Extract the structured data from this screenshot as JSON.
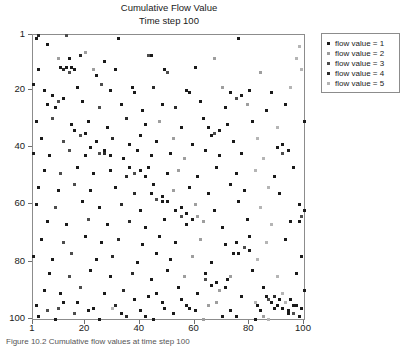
{
  "figure": {
    "title_lines": [
      "Cumulative Flow Value",
      "Time step 100"
    ],
    "caption": "Figure 10.2  Cumulative flow values at time step 100"
  },
  "axes": {
    "x_ticks": [
      "1",
      "20",
      "40",
      "60",
      "80",
      "100"
    ],
    "y_ticks": [
      "1",
      "20",
      "40",
      "60",
      "80",
      "100"
    ]
  },
  "legend": {
    "items": [
      {
        "label": "flow value = 1",
        "color": "#1a1a1a"
      },
      {
        "label": "flow value = 2",
        "color": "#9e9e9e"
      },
      {
        "label": "flow value = 3",
        "color": "#4d4d4d"
      },
      {
        "label": "flow value = 4",
        "color": "#2b2b2b"
      },
      {
        "label": "flow value = 5",
        "color": "#b5b5b5"
      }
    ]
  },
  "chart_data": {
    "type": "scatter",
    "title": "Cumulative Flow Value",
    "subtitle": "Time step 100",
    "xlabel": "",
    "ylabel": "",
    "xlim": [
      1,
      100
    ],
    "ylim": [
      1,
      100
    ],
    "y_inverted": true,
    "grid": false,
    "legend_position": "right-outside",
    "marker": "square",
    "marker_size_px": 3,
    "series": [
      {
        "name": "flow value = 1",
        "color": "#1a1a1a"
      },
      {
        "name": "flow value = 2",
        "color": "#9e9e9e"
      },
      {
        "name": "flow value = 3",
        "color": "#4d4d4d"
      },
      {
        "name": "flow value = 4",
        "color": "#2b2b2b"
      },
      {
        "name": "flow value = 5",
        "color": "#b5b5b5"
      }
    ],
    "points": [
      [
        2,
        2,
        1
      ],
      [
        3,
        1,
        4
      ],
      [
        6,
        4,
        1
      ],
      [
        13,
        1,
        3
      ],
      [
        32,
        2,
        1
      ],
      [
        76,
        2,
        1
      ],
      [
        98,
        5,
        5
      ],
      [
        10,
        9,
        2
      ],
      [
        14,
        9,
        1
      ],
      [
        18,
        8,
        4
      ],
      [
        20,
        7,
        2
      ],
      [
        27,
        10,
        1
      ],
      [
        43,
        8,
        3
      ],
      [
        44,
        8,
        1
      ],
      [
        67,
        9,
        2
      ],
      [
        97,
        9,
        5
      ],
      [
        3,
        13,
        1
      ],
      [
        11,
        12,
        1
      ],
      [
        12,
        13,
        4
      ],
      [
        13,
        12,
        1
      ],
      [
        14,
        14,
        3
      ],
      [
        15,
        12,
        1
      ],
      [
        16,
        13,
        1
      ],
      [
        23,
        13,
        2
      ],
      [
        24,
        15,
        1
      ],
      [
        31,
        13,
        1
      ],
      [
        49,
        13,
        1
      ],
      [
        50,
        14,
        3
      ],
      [
        60,
        12,
        1
      ],
      [
        84,
        14,
        2
      ],
      [
        99,
        13,
        5
      ],
      [
        1,
        18,
        1
      ],
      [
        5,
        20,
        1
      ],
      [
        17,
        19,
        1
      ],
      [
        26,
        18,
        3
      ],
      [
        29,
        20,
        1
      ],
      [
        37,
        19,
        1
      ],
      [
        38,
        21,
        1
      ],
      [
        45,
        19,
        4
      ],
      [
        57,
        20,
        1
      ],
      [
        58,
        21,
        1
      ],
      [
        70,
        19,
        2
      ],
      [
        80,
        20,
        1
      ],
      [
        88,
        21,
        1
      ],
      [
        95,
        19,
        5
      ],
      [
        6,
        25,
        1
      ],
      [
        9,
        26,
        1
      ],
      [
        19,
        24,
        1
      ],
      [
        25,
        26,
        3
      ],
      [
        33,
        25,
        1
      ],
      [
        41,
        27,
        1
      ],
      [
        48,
        25,
        1
      ],
      [
        53,
        26,
        4
      ],
      [
        62,
        24,
        1
      ],
      [
        71,
        26,
        1
      ],
      [
        79,
        25,
        2
      ],
      [
        86,
        27,
        1
      ],
      [
        93,
        25,
        1
      ],
      [
        2,
        31,
        1
      ],
      [
        8,
        30,
        3
      ],
      [
        15,
        32,
        1
      ],
      [
        21,
        31,
        1
      ],
      [
        28,
        33,
        1
      ],
      [
        35,
        30,
        4
      ],
      [
        42,
        32,
        1
      ],
      [
        47,
        31,
        2
      ],
      [
        55,
        33,
        1
      ],
      [
        63,
        30,
        1
      ],
      [
        72,
        32,
        1
      ],
      [
        81,
        31,
        1
      ],
      [
        90,
        33,
        5
      ],
      [
        100,
        31,
        1
      ],
      [
        4,
        37,
        1
      ],
      [
        12,
        38,
        3
      ],
      [
        18,
        36,
        1
      ],
      [
        24,
        38,
        1
      ],
      [
        30,
        37,
        4
      ],
      [
        36,
        39,
        1
      ],
      [
        40,
        36,
        1
      ],
      [
        46,
        38,
        1
      ],
      [
        52,
        37,
        2
      ],
      [
        59,
        39,
        1
      ],
      [
        66,
        36,
        1
      ],
      [
        74,
        38,
        1
      ],
      [
        83,
        37,
        5
      ],
      [
        92,
        39,
        1
      ],
      [
        1,
        42,
        1
      ],
      [
        7,
        43,
        1
      ],
      [
        14,
        41,
        3
      ],
      [
        20,
        43,
        1
      ],
      [
        27,
        42,
        4
      ],
      [
        34,
        44,
        1
      ],
      [
        39,
        41,
        1
      ],
      [
        44,
        43,
        1
      ],
      [
        51,
        42,
        1
      ],
      [
        56,
        44,
        2
      ],
      [
        64,
        41,
        1
      ],
      [
        69,
        43,
        1
      ],
      [
        77,
        42,
        1
      ],
      [
        85,
        44,
        5
      ],
      [
        94,
        41,
        1
      ],
      [
        5,
        48,
        1
      ],
      [
        11,
        49,
        3
      ],
      [
        17,
        47,
        1
      ],
      [
        23,
        49,
        1
      ],
      [
        29,
        48,
        1
      ],
      [
        35,
        50,
        4
      ],
      [
        43,
        47,
        1
      ],
      [
        50,
        49,
        1
      ],
      [
        54,
        48,
        2
      ],
      [
        61,
        50,
        1
      ],
      [
        68,
        47,
        1
      ],
      [
        75,
        49,
        1
      ],
      [
        82,
        48,
        5
      ],
      [
        89,
        50,
        1
      ],
      [
        96,
        47,
        1
      ],
      [
        3,
        54,
        1
      ],
      [
        10,
        55,
        1
      ],
      [
        16,
        53,
        3
      ],
      [
        22,
        55,
        1
      ],
      [
        31,
        54,
        1
      ],
      [
        38,
        56,
        4
      ],
      [
        45,
        53,
        1
      ],
      [
        52,
        55,
        2
      ],
      [
        58,
        54,
        1
      ],
      [
        65,
        56,
        1
      ],
      [
        73,
        53,
        1
      ],
      [
        78,
        55,
        1
      ],
      [
        87,
        54,
        5
      ],
      [
        91,
        56,
        1
      ],
      [
        2,
        60,
        1
      ],
      [
        9,
        61,
        3
      ],
      [
        19,
        59,
        1
      ],
      [
        25,
        61,
        1
      ],
      [
        33,
        60,
        4
      ],
      [
        40,
        62,
        1
      ],
      [
        48,
        59,
        1
      ],
      [
        55,
        61,
        1
      ],
      [
        60,
        60,
        2
      ],
      [
        67,
        62,
        1
      ],
      [
        76,
        59,
        1
      ],
      [
        84,
        61,
        5
      ],
      [
        98,
        60,
        1
      ],
      [
        6,
        66,
        1
      ],
      [
        13,
        67,
        1
      ],
      [
        21,
        65,
        3
      ],
      [
        28,
        67,
        1
      ],
      [
        36,
        66,
        4
      ],
      [
        42,
        68,
        1
      ],
      [
        49,
        65,
        1
      ],
      [
        57,
        67,
        1
      ],
      [
        63,
        66,
        2
      ],
      [
        70,
        68,
        1
      ],
      [
        79,
        65,
        1
      ],
      [
        88,
        67,
        5
      ],
      [
        95,
        66,
        1
      ],
      [
        4,
        72,
        1
      ],
      [
        12,
        73,
        3
      ],
      [
        20,
        71,
        1
      ],
      [
        26,
        73,
        1
      ],
      [
        32,
        72,
        4
      ],
      [
        41,
        74,
        1
      ],
      [
        47,
        71,
        1
      ],
      [
        53,
        73,
        1
      ],
      [
        62,
        72,
        2
      ],
      [
        71,
        74,
        1
      ],
      [
        80,
        71,
        1
      ],
      [
        86,
        73,
        5
      ],
      [
        93,
        72,
        1
      ],
      [
        1,
        78,
        1
      ],
      [
        8,
        79,
        1
      ],
      [
        15,
        77,
        3
      ],
      [
        24,
        79,
        1
      ],
      [
        30,
        78,
        4
      ],
      [
        39,
        80,
        1
      ],
      [
        46,
        77,
        1
      ],
      [
        51,
        79,
        1
      ],
      [
        59,
        78,
        2
      ],
      [
        66,
        80,
        1
      ],
      [
        74,
        77,
        1
      ],
      [
        83,
        79,
        5
      ],
      [
        99,
        78,
        1
      ],
      [
        7,
        84,
        1
      ],
      [
        14,
        85,
        3
      ],
      [
        22,
        83,
        1
      ],
      [
        29,
        85,
        1
      ],
      [
        37,
        84,
        4
      ],
      [
        44,
        86,
        1
      ],
      [
        50,
        83,
        1
      ],
      [
        56,
        85,
        2
      ],
      [
        64,
        84,
        1
      ],
      [
        72,
        86,
        1
      ],
      [
        81,
        83,
        1
      ],
      [
        90,
        85,
        5
      ],
      [
        97,
        84,
        1
      ],
      [
        5,
        90,
        1
      ],
      [
        11,
        91,
        1
      ],
      [
        18,
        89,
        3
      ],
      [
        27,
        91,
        1
      ],
      [
        34,
        90,
        4
      ],
      [
        43,
        92,
        1
      ],
      [
        54,
        89,
        1
      ],
      [
        61,
        91,
        1
      ],
      [
        69,
        90,
        2
      ],
      [
        77,
        92,
        1
      ],
      [
        85,
        89,
        1
      ],
      [
        92,
        91,
        5
      ],
      [
        100,
        90,
        1
      ],
      [
        2,
        95,
        1
      ],
      [
        10,
        96,
        3
      ],
      [
        17,
        94,
        1
      ],
      [
        23,
        96,
        1
      ],
      [
        31,
        95,
        4
      ],
      [
        40,
        97,
        1
      ],
      [
        48,
        94,
        1
      ],
      [
        58,
        96,
        1
      ],
      [
        65,
        95,
        2
      ],
      [
        73,
        97,
        1
      ],
      [
        82,
        94,
        5
      ],
      [
        89,
        96,
        1
      ],
      [
        96,
        95,
        1
      ],
      [
        3,
        99,
        1
      ],
      [
        9,
        100,
        1
      ],
      [
        16,
        98,
        3
      ],
      [
        25,
        100,
        1
      ],
      [
        35,
        99,
        4
      ],
      [
        45,
        100,
        1
      ],
      [
        52,
        98,
        1
      ],
      [
        63,
        100,
        2
      ],
      [
        75,
        99,
        1
      ],
      [
        87,
        100,
        5
      ],
      [
        94,
        98,
        1
      ],
      [
        86,
        92,
        1
      ],
      [
        87,
        93,
        3
      ],
      [
        88,
        94,
        1
      ],
      [
        89,
        92,
        4
      ],
      [
        90,
        95,
        1
      ],
      [
        91,
        93,
        1
      ],
      [
        92,
        96,
        1
      ],
      [
        93,
        94,
        5
      ],
      [
        94,
        97,
        1
      ],
      [
        95,
        93,
        1
      ],
      [
        96,
        98,
        3
      ],
      [
        97,
        95,
        1
      ],
      [
        98,
        99,
        1
      ],
      [
        99,
        96,
        1
      ],
      [
        84,
        97,
        1
      ],
      [
        85,
        99,
        2
      ],
      [
        83,
        95,
        1
      ],
      [
        82,
        100,
        1
      ],
      [
        30,
        96,
        5
      ],
      [
        33,
        98,
        1
      ],
      [
        21,
        97,
        1
      ],
      [
        12,
        94,
        1
      ],
      [
        6,
        97,
        3
      ],
      [
        55,
        93,
        1
      ],
      [
        57,
        95,
        1
      ],
      [
        60,
        97,
        1
      ],
      [
        68,
        94,
        2
      ],
      [
        70,
        99,
        1
      ],
      [
        46,
        91,
        1
      ],
      [
        38,
        93,
        1
      ],
      [
        42,
        99,
        1
      ],
      [
        49,
        96,
        1
      ],
      [
        64,
        86,
        3
      ],
      [
        66,
        88,
        1
      ],
      [
        68,
        87,
        1
      ],
      [
        71,
        89,
        1
      ],
      [
        73,
        85,
        2
      ],
      [
        75,
        73,
        1
      ],
      [
        78,
        75,
        3
      ],
      [
        76,
        77,
        1
      ],
      [
        80,
        76,
        1
      ],
      [
        53,
        62,
        1
      ],
      [
        55,
        64,
        3
      ],
      [
        57,
        63,
        1
      ],
      [
        59,
        65,
        1
      ],
      [
        61,
        64,
        2
      ],
      [
        44,
        56,
        1
      ],
      [
        46,
        58,
        3
      ],
      [
        48,
        57,
        1
      ],
      [
        50,
        59,
        1
      ],
      [
        36,
        47,
        1
      ],
      [
        38,
        49,
        3
      ],
      [
        40,
        48,
        1
      ],
      [
        42,
        50,
        1
      ],
      [
        22,
        40,
        1
      ],
      [
        25,
        42,
        3
      ],
      [
        27,
        41,
        1
      ],
      [
        29,
        43,
        1
      ],
      [
        16,
        34,
        1
      ],
      [
        18,
        36,
        3
      ],
      [
        20,
        35,
        1
      ],
      [
        8,
        22,
        1
      ],
      [
        10,
        24,
        3
      ],
      [
        12,
        23,
        1
      ],
      [
        73,
        21,
        1
      ],
      [
        75,
        23,
        3
      ],
      [
        77,
        22,
        1
      ],
      [
        90,
        40,
        1
      ],
      [
        92,
        42,
        3
      ],
      [
        94,
        41,
        1
      ],
      [
        65,
        33,
        1
      ],
      [
        67,
        35,
        3
      ],
      [
        69,
        34,
        1
      ],
      [
        100,
        62,
        1
      ],
      [
        99,
        64,
        3
      ],
      [
        98,
        66,
        1
      ]
    ]
  }
}
